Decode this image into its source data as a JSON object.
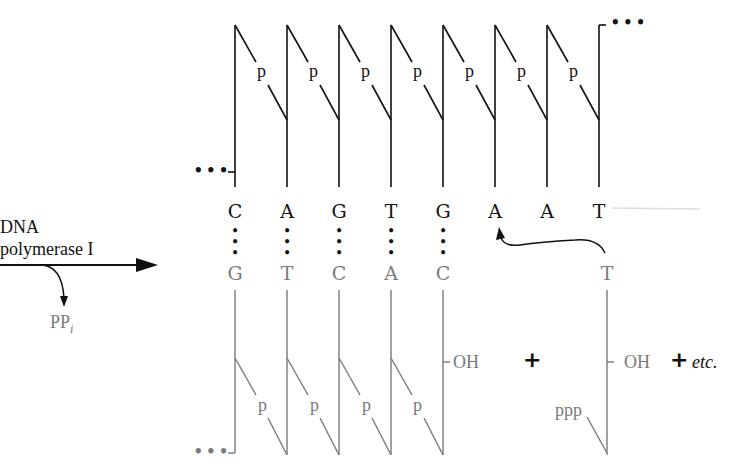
{
  "enzyme": {
    "line1": "DNA",
    "line2": "polymerase I"
  },
  "byproduct": {
    "main": "PP",
    "sub": "i"
  },
  "template_strand": {
    "bases": [
      "C",
      "A",
      "G",
      "T",
      "G",
      "A",
      "A",
      "T"
    ],
    "phosphate_label": "p",
    "ellipsis": "•••",
    "color": "#111111"
  },
  "new_strand": {
    "bases": [
      "G",
      "T",
      "C",
      "A",
      "C"
    ],
    "phosphate_label": "p",
    "terminal_label": "OH",
    "ellipsis": "•••",
    "color": "#7a7a7a"
  },
  "incoming_nucleotide": {
    "base": "T",
    "triphosphate_label": "ppp",
    "terminal_label": "OH"
  },
  "operators": {
    "plus_1": "+",
    "plus_2": "+",
    "etc": "etc."
  },
  "pairing_glyph": "•"
}
